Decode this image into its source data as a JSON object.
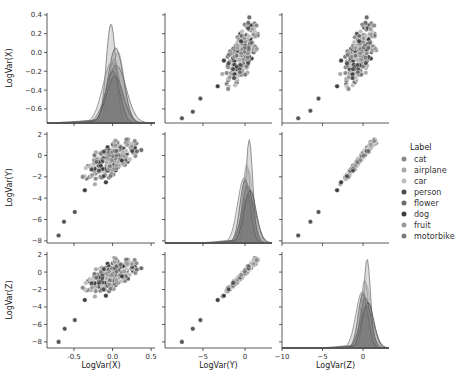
{
  "chart_data": {
    "type": "scatter",
    "kind": "pairplot",
    "variables": [
      "LogVar(X)",
      "LogVar(Y)",
      "LogVar(Z)"
    ],
    "diagonal": "kde",
    "hue": "Label",
    "legend": {
      "title": "Label",
      "position": "right",
      "entries": [
        {
          "label": "cat",
          "color": "#8a8a8a"
        },
        {
          "label": "airplane",
          "color": "#a9a9a9"
        },
        {
          "label": "car",
          "color": "#bdbdbd"
        },
        {
          "label": "person",
          "color": "#4d4d4d"
        },
        {
          "label": "flower",
          "color": "#6b6b6b"
        },
        {
          "label": "dog",
          "color": "#3f3f3f"
        },
        {
          "label": "fruit",
          "color": "#9a9a9a"
        },
        {
          "label": "motorbike",
          "color": "#7a7a7a"
        }
      ]
    },
    "axes": {
      "LogVar(X)": {
        "range": [
          -0.85,
          0.55
        ],
        "ticks": [
          -0.5,
          0.0,
          0.5
        ],
        "tick_labels": [
          "-0.5",
          "0.0",
          "0.5"
        ],
        "y_range": [
          -0.75,
          0.42
        ],
        "y_ticks": [
          0.4,
          0.2,
          0.0,
          -0.2,
          -0.4,
          -0.6
        ],
        "y_tick_labels": [
          "0.4",
          "0.2",
          "0.0",
          "−0.2",
          "−0.4",
          "−0.6"
        ]
      },
      "LogVar(Y)": {
        "range": [
          -9.5,
          3.2
        ],
        "ticks": [
          -5,
          0
        ],
        "tick_labels": [
          "−5",
          "0"
        ],
        "y_range": [
          -8.2,
          2.2
        ],
        "y_ticks": [
          2,
          0,
          -2,
          -4,
          -6,
          -8
        ],
        "y_tick_labels": [
          "2",
          "0",
          "−2",
          "−4",
          "−6",
          "−8"
        ]
      },
      "LogVar(Z)": {
        "range": [
          -10,
          3.2
        ],
        "ticks": [
          -10,
          -5,
          0
        ],
        "tick_labels": [
          "−10",
          "−5",
          "0"
        ],
        "y_range": [
          -8.7,
          2.3
        ],
        "y_ticks": [
          2,
          0,
          -2,
          -4,
          -6,
          -8
        ],
        "y_tick_labels": [
          "2",
          "0",
          "−2",
          "−4",
          "−6",
          "−8"
        ]
      }
    },
    "outlier_points": {
      "x_vs_y": [
        [
          -0.7,
          -7.5
        ],
        [
          -0.63,
          -6.2
        ],
        [
          -0.49,
          -5.3
        ]
      ],
      "x_vs_z": [
        [
          -0.7,
          -8.0
        ],
        [
          -0.62,
          -6.5
        ],
        [
          -0.49,
          -5.5
        ]
      ],
      "y_vs_z": [
        [
          -7.5,
          -8.0
        ],
        [
          -6.2,
          -6.5
        ],
        [
          -5.3,
          -5.5
        ]
      ]
    },
    "cluster": {
      "x_center": 0.0,
      "x_spread": 0.14,
      "y_center": -0.3,
      "y_spread": 1.1,
      "z_center": -0.3,
      "z_spread": 1.1
    },
    "kde_peaks": {
      "LogVar(X)": {
        "peak_x": -0.02,
        "peak_density_label": "0.35"
      },
      "LogVar(Y)": {
        "peak_x": 0.5
      },
      "LogVar(Z)": {
        "peak_x": 0.5
      }
    }
  },
  "labels": {
    "x_axis": [
      "LogVar(X)",
      "LogVar(Y)",
      "LogVar(Z)"
    ],
    "y_axis": [
      "LogVar(X)",
      "LogVar(Y)",
      "LogVar(Z)"
    ],
    "legend_title": "Label"
  }
}
